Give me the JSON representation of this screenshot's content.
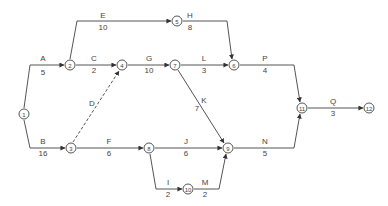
{
  "diagram": {
    "type": "activity-on-arrow network",
    "line_color": "#555555",
    "nodes": [
      {
        "id": "1",
        "x": 24,
        "y": 114
      },
      {
        "id": "2",
        "x": 70,
        "y": 65
      },
      {
        "id": "3",
        "x": 71,
        "y": 148
      },
      {
        "id": "4",
        "x": 122,
        "y": 65
      },
      {
        "id": "5",
        "x": 177,
        "y": 21
      },
      {
        "id": "6",
        "x": 234,
        "y": 65
      },
      {
        "id": "7",
        "x": 175,
        "y": 65
      },
      {
        "id": "8",
        "x": 149,
        "y": 148
      },
      {
        "id": "9",
        "x": 228,
        "y": 148
      },
      {
        "id": "10",
        "x": 188,
        "y": 189
      },
      {
        "id": "11",
        "x": 302,
        "y": 108
      },
      {
        "id": "12",
        "x": 369,
        "y": 108
      }
    ],
    "activities": [
      {
        "name": "A",
        "duration": "5",
        "from": "1",
        "to": "2",
        "dashed": false,
        "path": "M24,108 L30,65 L64,65",
        "name_x": 43,
        "name_y": 61,
        "dur_x": 43,
        "dur_y": 75
      },
      {
        "name": "B",
        "duration": "16",
        "from": "1",
        "to": "3",
        "dashed": false,
        "path": "M24,120 L30,148 L65,148",
        "name_x": 43,
        "name_y": 144,
        "dur_x": 43,
        "dur_y": 156
      },
      {
        "name": "E",
        "duration": "10",
        "from": "2",
        "to": "5",
        "dashed": false,
        "path": "M70,59 L77,21 L171,21",
        "name_x": 103,
        "name_y": 18,
        "dur_x": 103,
        "dur_y": 30
      },
      {
        "name": "C",
        "duration": "2",
        "from": "2",
        "to": "4",
        "dashed": false,
        "path": "M76,65 L116,65",
        "name_x": 94,
        "name_y": 61,
        "dur_x": 94,
        "dur_y": 73
      },
      {
        "name": "D",
        "duration": "",
        "from": "3",
        "to": "4",
        "dashed": true,
        "path": "M73,142 L119,71",
        "name_x": 92,
        "name_y": 106,
        "dur_x": 0,
        "dur_y": 0
      },
      {
        "name": "F",
        "duration": "6",
        "from": "3",
        "to": "8",
        "dashed": false,
        "path": "M77,148 L143,148",
        "name_x": 109,
        "name_y": 144,
        "dur_x": 109,
        "dur_y": 156
      },
      {
        "name": "H",
        "duration": "8",
        "from": "5",
        "to": "6",
        "dashed": false,
        "path": "M183,21 L227,21 L232,59",
        "name_x": 190,
        "name_y": 18,
        "dur_x": 190,
        "dur_y": 30
      },
      {
        "name": "G",
        "duration": "10",
        "from": "4",
        "to": "7",
        "dashed": false,
        "path": "M128,65 L169,65",
        "name_x": 149,
        "name_y": 61,
        "dur_x": 149,
        "dur_y": 73
      },
      {
        "name": "L",
        "duration": "3",
        "from": "7",
        "to": "6",
        "dashed": false,
        "path": "M181,65 L228,65",
        "name_x": 204,
        "name_y": 61,
        "dur_x": 204,
        "dur_y": 73
      },
      {
        "name": "K",
        "duration": "7",
        "from": "7",
        "to": "9",
        "dashed": false,
        "path": "M178,70 L224,143",
        "name_x": 204,
        "name_y": 103,
        "dur_x": 197,
        "dur_y": 111
      },
      {
        "name": "P",
        "duration": "4",
        "from": "6",
        "to": "11",
        "dashed": false,
        "path": "M240,65 L294,65 L300,102",
        "name_x": 265,
        "name_y": 61,
        "dur_x": 265,
        "dur_y": 73
      },
      {
        "name": "J",
        "duration": "6",
        "from": "8",
        "to": "9",
        "dashed": false,
        "path": "M155,148 L222,148",
        "name_x": 186,
        "name_y": 144,
        "dur_x": 186,
        "dur_y": 156
      },
      {
        "name": "N",
        "duration": "5",
        "from": "9",
        "to": "11",
        "dashed": false,
        "path": "M234,148 L294,148 L300,114",
        "name_x": 265,
        "name_y": 144,
        "dur_x": 265,
        "dur_y": 156
      },
      {
        "name": "I",
        "duration": "2",
        "from": "8",
        "to": "10",
        "dashed": false,
        "path": "M150,154 L156,189 L182,189",
        "name_x": 168,
        "name_y": 185,
        "dur_x": 168,
        "dur_y": 197
      },
      {
        "name": "M",
        "duration": "2",
        "from": "10",
        "to": "9",
        "dashed": false,
        "path": "M194,189 L219,189 L226,154",
        "name_x": 205,
        "name_y": 185,
        "dur_x": 205,
        "dur_y": 197
      },
      {
        "name": "Q",
        "duration": "3",
        "from": "11",
        "to": "12",
        "dashed": false,
        "path": "M308,108 L363,108",
        "name_x": 333,
        "name_y": 104,
        "dur_x": 333,
        "dur_y": 116
      }
    ]
  }
}
